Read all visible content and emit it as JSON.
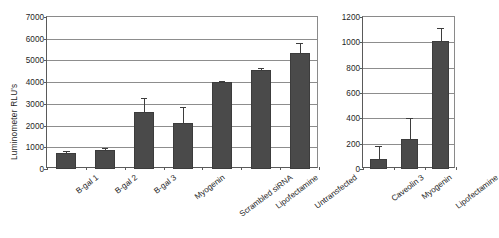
{
  "figure": {
    "background": "#ffffff",
    "bar_color": "#4a4a4a",
    "axis_color": "#5a5a5a",
    "grid_color": "#8d8d8d"
  },
  "chart_data": [
    {
      "type": "bar",
      "panel": "left",
      "title": "",
      "xlabel": "",
      "ylabel": "Luminometer RLU's",
      "ylim": [
        0,
        7000
      ],
      "yticks": [
        0,
        1000,
        2000,
        3000,
        4000,
        5000,
        6000,
        7000
      ],
      "ytick_labels": [
        "0",
        "1000",
        "2000",
        "3000",
        "4000",
        "5000",
        "6000",
        "7000"
      ],
      "grid": true,
      "legend": "none",
      "categories": [
        "B-gal 1",
        "B-gal 2",
        "B-gal 3",
        "Myogenin",
        "Scrambled siRNA",
        "Lipofectamine",
        "Untransfected"
      ],
      "values": [
        750,
        880,
        2620,
        2110,
        4000,
        4550,
        5340
      ],
      "errors": [
        70,
        90,
        640,
        740,
        60,
        110,
        470
      ]
    },
    {
      "type": "bar",
      "panel": "right",
      "title": "",
      "xlabel": "",
      "ylabel": "",
      "ylim": [
        0,
        1200
      ],
      "yticks": [
        0,
        200,
        400,
        600,
        800,
        1000,
        1200
      ],
      "ytick_labels": [
        "0",
        "200",
        "400",
        "600",
        "800",
        "1000",
        "1200"
      ],
      "grid": true,
      "legend": "none",
      "categories": [
        "Caveolin 3",
        "Myogenin",
        "Lipofectamine"
      ],
      "values": [
        80,
        235,
        1010
      ],
      "errors": [
        100,
        168,
        105
      ]
    }
  ]
}
